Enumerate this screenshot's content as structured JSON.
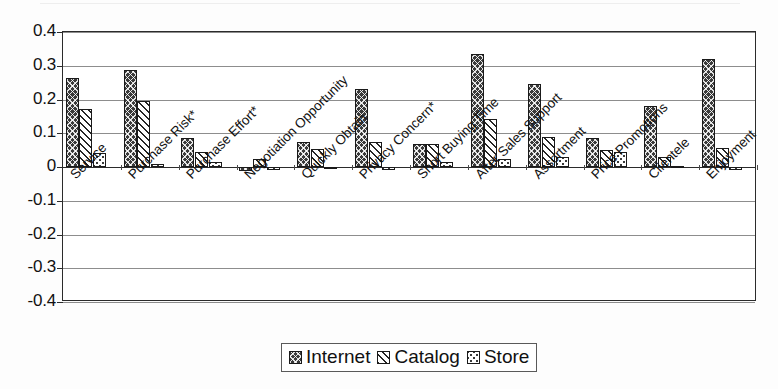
{
  "chart_data": {
    "type": "bar",
    "title": "",
    "xlabel": "",
    "ylabel": "",
    "ylim": [
      -0.4,
      0.4
    ],
    "ytick_labels": [
      "0.4",
      "0.3",
      "0.2",
      "0.1",
      "0",
      "-0.1",
      "-0.2",
      "-0.3",
      "-0.4"
    ],
    "ytick_values": [
      0.4,
      0.3,
      0.2,
      0.1,
      0,
      -0.1,
      -0.2,
      -0.3,
      -0.4
    ],
    "grid": true,
    "legend_position": "bottom-center",
    "categories": [
      "Service",
      "Purchase Risk*",
      "Purchase Effort*",
      "Negotiation Opportunity",
      "Quickly Obtain",
      "Privacy Concern*",
      "Short Buying Time",
      "After Sales Support",
      "Assortment",
      "Price Promotions",
      "Clientele",
      "Enjoyment"
    ],
    "series": [
      {
        "name": "Internet",
        "pattern": "dark-crosshatch",
        "values": [
          0.263,
          0.288,
          0.085,
          -0.012,
          0.075,
          0.23,
          0.068,
          0.335,
          0.245,
          0.085,
          0.18,
          0.32
        ]
      },
      {
        "name": "Catalog",
        "pattern": "diagonal-hatch",
        "values": [
          0.173,
          0.196,
          0.045,
          0.025,
          0.053,
          0.075,
          0.068,
          0.142,
          0.09,
          0.05,
          0.03,
          0.055
        ]
      },
      {
        "name": "Store",
        "pattern": "dotted",
        "values": [
          0.042,
          0.01,
          0.016,
          -0.009,
          0.0,
          -0.01,
          0.014,
          0.024,
          0.03,
          0.045,
          0.002,
          -0.01
        ]
      }
    ]
  },
  "legend": {
    "items": [
      {
        "label": "Internet"
      },
      {
        "label": "Catalog"
      },
      {
        "label": "Store"
      }
    ]
  }
}
